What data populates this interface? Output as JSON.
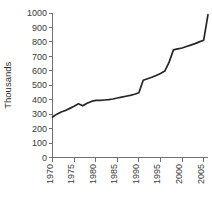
{
  "chart_data": {
    "type": "line",
    "title": "",
    "subtitle": "",
    "xlabel": "",
    "ylabel": "Thousands",
    "xlim": [
      1970,
      2006
    ],
    "ylim": [
      0,
      1000
    ],
    "grid": false,
    "legend": null,
    "line_color": "#262626",
    "axis_color": "#6f6f6f",
    "y_ticks": [
      0,
      100,
      200,
      300,
      400,
      500,
      600,
      700,
      800,
      900,
      1000
    ],
    "y_tick_labels": [
      "0",
      "100",
      "200",
      "300",
      "400",
      "500",
      "600",
      "700",
      "800",
      "900",
      "1000"
    ],
    "x_ticks": [
      1970,
      1975,
      1980,
      1985,
      1990,
      1995,
      2000,
      2005
    ],
    "x_tick_labels": [
      "1970",
      "1975",
      "1980",
      "1985",
      "1990",
      "1995",
      "2000",
      "2005"
    ],
    "series": [
      {
        "name": "Thousands",
        "x": [
          1970,
          1971,
          1972,
          1973,
          1974,
          1975,
          1976,
          1977,
          1978,
          1979,
          1980,
          1981,
          1982,
          1983,
          1984,
          1985,
          1986,
          1987,
          1988,
          1989,
          1990,
          1991,
          1992,
          1993,
          1994,
          1995,
          1996,
          1997,
          1998,
          1999,
          2000,
          2001,
          2002,
          2003,
          2004,
          2005,
          2006
        ],
        "values": [
          280,
          300,
          315,
          325,
          340,
          355,
          372,
          358,
          375,
          388,
          395,
          396,
          398,
          400,
          405,
          412,
          418,
          424,
          430,
          438,
          448,
          535,
          545,
          555,
          568,
          582,
          598,
          660,
          745,
          752,
          758,
          768,
          778,
          788,
          800,
          812,
          988
        ]
      }
    ]
  }
}
